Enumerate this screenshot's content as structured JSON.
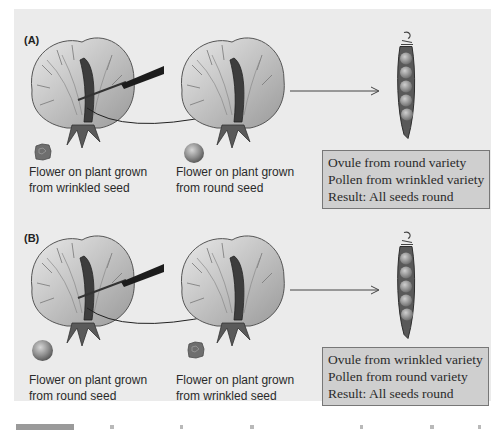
{
  "panels": [
    {
      "label": "(A)",
      "flower_left_caption": [
        "Flower on plant grown",
        "from wrinkled seed"
      ],
      "flower_left_seed": "wrinkled-seed",
      "flower_right_caption": [
        "Flower on plant grown",
        "from round seed"
      ],
      "flower_right_seed": "round-seed",
      "result_lines": [
        "Ovule from round variety",
        "Pollen from wrinkled variety",
        "Result:  All seeds round"
      ]
    },
    {
      "label": "(B)",
      "flower_left_caption": [
        "Flower on plant grown",
        "from round seed"
      ],
      "flower_left_seed": "round-seed",
      "flower_right_caption": [
        "Flower on plant grown",
        "from wrinkled seed"
      ],
      "flower_right_seed": "wrinkled-seed",
      "result_lines": [
        "Ovule from wrinkled variety",
        "Pollen from round variety",
        "Result:  All seeds round"
      ]
    }
  ],
  "colors": {
    "panel_bg": "#ebebeb",
    "result_box_bg": "#cfcfcf",
    "result_box_border": "#777777"
  }
}
